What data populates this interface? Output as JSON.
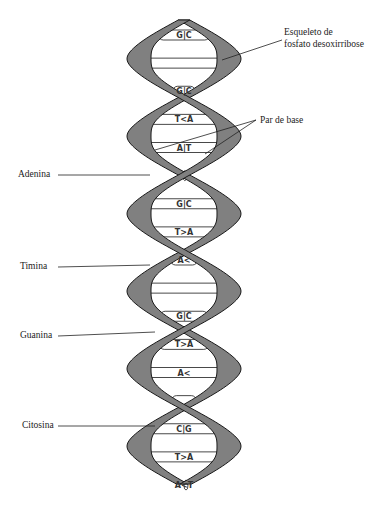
{
  "diagram": {
    "labels": {
      "backbone": [
        "Esqueleto de",
        "fosfato desoxirribose"
      ],
      "base_pair": "Par de base",
      "adenine": "Adenina",
      "thymine": "Timina",
      "guanine": "Guanina",
      "cytosine": "Citosina"
    },
    "base_pairs": [
      "G|C",
      "",
      "G|C",
      "T<A",
      "A|T",
      "",
      "G|C",
      "T>A",
      "A<",
      "",
      "G|C",
      "T>A",
      "A<",
      "",
      "C|G",
      "T>A",
      "A<T"
    ],
    "colors": {
      "backbone": "#808080",
      "backbone_outline": "#1a1a1a",
      "base_pair_fill": "#ffffff",
      "leader_line": "#222222"
    }
  }
}
